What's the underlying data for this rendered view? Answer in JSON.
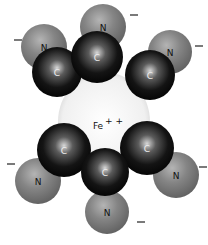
{
  "diagram": {
    "center_atom": {
      "label": "Fe",
      "charge": "++",
      "x": 104,
      "y": 122,
      "r": 46,
      "color": "#f4f4f4"
    },
    "carbon_color": "#1a1a1a",
    "nitrogen_color": "#7e7e7e",
    "ligands": [
      {
        "position": "top",
        "c": {
          "label": "C",
          "x": 97,
          "y": 57,
          "r": 26
        },
        "n": {
          "label": "N",
          "x": 103,
          "y": 27,
          "r": 23
        },
        "minus": {
          "label": "–",
          "x": 134,
          "y": 15
        }
      },
      {
        "position": "top-left",
        "c": {
          "label": "C",
          "x": 57,
          "y": 72,
          "r": 25
        },
        "n": {
          "label": "N",
          "x": 44,
          "y": 47,
          "r": 23
        },
        "minus": {
          "label": "–",
          "x": 18,
          "y": 40
        }
      },
      {
        "position": "top-right",
        "c": {
          "label": "C",
          "x": 150,
          "y": 75,
          "r": 25
        },
        "n": {
          "label": "N",
          "x": 170,
          "y": 52,
          "r": 22
        },
        "minus": {
          "label": "–",
          "x": 199,
          "y": 46
        }
      },
      {
        "position": "bottom-left",
        "c": {
          "label": "C",
          "x": 64,
          "y": 150,
          "r": 27
        },
        "n": {
          "label": "N",
          "x": 38,
          "y": 181,
          "r": 23
        },
        "minus": {
          "label": "–",
          "x": 11,
          "y": 164
        }
      },
      {
        "position": "bottom-right",
        "c": {
          "label": "C",
          "x": 147,
          "y": 148,
          "r": 27
        },
        "n": {
          "label": "N",
          "x": 176,
          "y": 175,
          "r": 23
        },
        "minus": {
          "label": "–",
          "x": 203,
          "y": 167
        }
      },
      {
        "position": "bottom",
        "c": {
          "label": "C",
          "x": 105,
          "y": 172,
          "r": 24
        },
        "n": {
          "label": "N",
          "x": 107,
          "y": 212,
          "r": 22
        },
        "minus": {
          "label": "–",
          "x": 141,
          "y": 222
        }
      }
    ]
  }
}
